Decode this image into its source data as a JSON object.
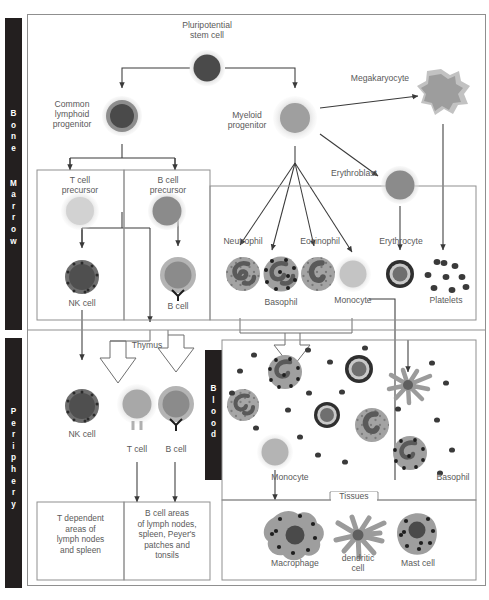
{
  "figure": {
    "compartments": [
      {
        "name": "bone-marrow",
        "label": "Bone Marrow",
        "letters": "B o n e   M a r r o w"
      },
      {
        "name": "periphery",
        "label": "Periphery",
        "letters": "P e r i p h e r y"
      },
      {
        "name": "blood",
        "label": "Blood",
        "letters": "B l o o d"
      }
    ],
    "inset_label": "Tissues"
  },
  "bone_marrow": {
    "stem_cell": "Pluripotential\nstem cell",
    "common_lymphoid_progenitor": "Common\nlymphoid\nprogenitor",
    "myeloid_progenitor": "Myeloid\nprogenitor",
    "megakaryocyte": "Megakaryocyte",
    "erythroblast": "Erythroblast",
    "t_cell_precursor": "T cell\nprecursor",
    "b_cell_precursor": "B cell\nprecursor",
    "nk_cell": "NK cell",
    "b_cell": "B cell",
    "neutrophil": "Neutrophil",
    "basophil": "Basophil",
    "eosinophil": "Eosinophil",
    "monocyte": "Monocyte",
    "erythrocyte": "Erythrocyte",
    "platelets": "Platelets"
  },
  "periphery": {
    "thymus": "Thymus",
    "nk_cell": "NK cell",
    "t_cell": "T cell",
    "b_cell": "B cell",
    "blood_monocyte": "Monocyte",
    "blood_basophil": "Basophil",
    "t_dependent_box": "T dependent\nareas of\nlymph nodes\nand spleen",
    "b_cell_box": "B cell areas\nof lymph nodes,\nspleen, Peyer's\npatches and\ntonsils",
    "macrophage": "Macrophage",
    "dendritic_cell": "dendritic\ncell",
    "mast_cell": "Mast cell"
  },
  "colors": {
    "bar_background": "#231f1f",
    "bar_text": "#ffffff",
    "frame_border": "#8f8f8f",
    "label_text": "#5a5a5a",
    "nucleus_dark": "#4a4a4a",
    "cytoplasm_light": "#c9c9c9",
    "cytoplasm_mid": "#9a9a9a",
    "halo": "#d6d6d6",
    "line": "#3a3a3a"
  }
}
